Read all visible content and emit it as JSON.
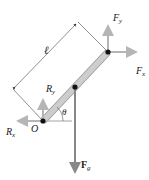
{
  "diagram": {
    "labels": {
      "length": "ℓ",
      "Fy": "F",
      "Fy_sub": "y",
      "Fx": "F",
      "Fx_sub": "x",
      "Ry": "R",
      "Ry_sub": "y",
      "Rx": "R",
      "Rx_sub": "x",
      "pivot": "O",
      "angle": "θ",
      "Fg": "F",
      "Fg_sub": "g"
    },
    "colors": {
      "rod_fill": "#c8c8c8",
      "rod_stroke": "#9a9a9a",
      "arrow": "#b0b0b0",
      "force_g": "#8c8c8c",
      "dot": "#111111",
      "line": "#333333"
    }
  }
}
